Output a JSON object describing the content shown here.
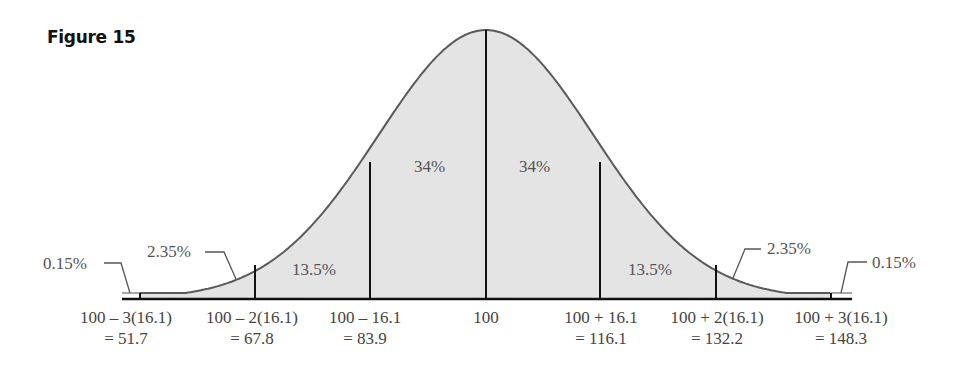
{
  "figure": {
    "title": "Figure 15"
  },
  "chart_data": {
    "type": "area",
    "title": "Figure 15",
    "mean": 100,
    "sd": 16.1,
    "x_ticks": [
      {
        "expr": "100 – 3(16.1)",
        "value": "= 51.7",
        "x": 51.7
      },
      {
        "expr": "100 – 2(16.1)",
        "value": "= 67.8",
        "x": 67.8
      },
      {
        "expr": "100 – 16.1",
        "value": "= 83.9",
        "x": 83.9
      },
      {
        "expr": "100",
        "value": "",
        "x": 100
      },
      {
        "expr": "100 + 16.1",
        "value": "= 116.1",
        "x": 116.1
      },
      {
        "expr": "100 + 2(16.1)",
        "value": "= 132.2",
        "x": 132.2
      },
      {
        "expr": "100 + 3(16.1)",
        "value": "= 148.3",
        "x": 148.3
      }
    ],
    "regions": [
      {
        "from": null,
        "to": 51.7,
        "percent": "0.15%"
      },
      {
        "from": 51.7,
        "to": 67.8,
        "percent": "2.35%"
      },
      {
        "from": 67.8,
        "to": 83.9,
        "percent": "13.5%"
      },
      {
        "from": 83.9,
        "to": 100,
        "percent": "34%"
      },
      {
        "from": 100,
        "to": 116.1,
        "percent": "34%"
      },
      {
        "from": 116.1,
        "to": 132.2,
        "percent": "13.5%"
      },
      {
        "from": 132.2,
        "to": 148.3,
        "percent": "2.35%"
      },
      {
        "from": 148.3,
        "to": null,
        "percent": "0.15%"
      }
    ],
    "xlabel": "",
    "ylabel": "",
    "grid": false,
    "legend": null
  },
  "labels": {
    "left_tail": "0.15%",
    "left_2": "2.35%",
    "left_13": "13.5%",
    "left_34": "34%",
    "right_34": "34%",
    "right_13": "13.5%",
    "right_2": "2.35%",
    "right_tail": "0.15%"
  },
  "colors": {
    "fill": "#e4e4e4",
    "curve": "#5a5a5a",
    "lines": "#111111",
    "text": "#555555"
  }
}
